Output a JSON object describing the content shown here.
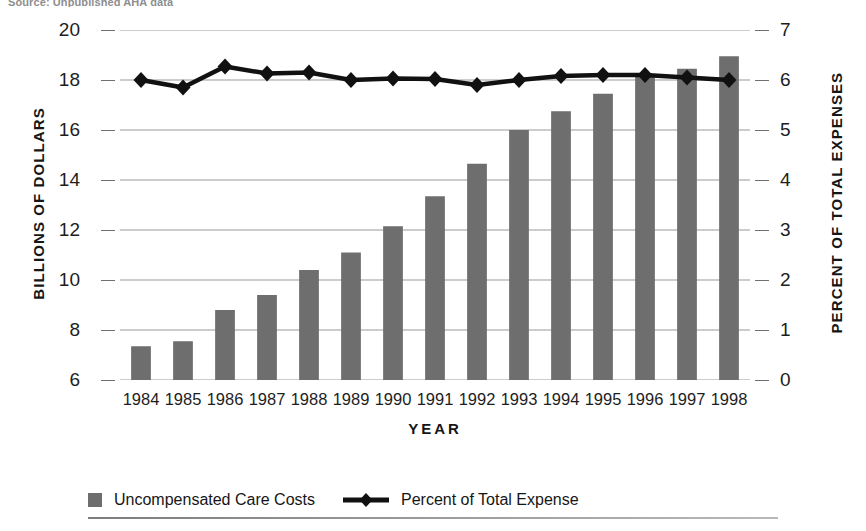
{
  "top_caption": "Source: Unpublished AHA data",
  "chart_data": {
    "type": "bar",
    "title": "",
    "subtitle": "",
    "xlabel": "YEAR",
    "ylabel": "BILLIONS OF DOLLARS",
    "y2label": "PERCENT OF TOTAL EXPENSES",
    "categories": [
      "1984",
      "1985",
      "1986",
      "1987",
      "1988",
      "1989",
      "1990",
      "1991",
      "1992",
      "1993",
      "1994",
      "1995",
      "1996",
      "1997",
      "1998"
    ],
    "ylim": [
      6,
      20
    ],
    "yticks": [
      6,
      8,
      10,
      12,
      14,
      16,
      18,
      20
    ],
    "y2lim": [
      0,
      7
    ],
    "y2ticks": [
      0,
      1,
      2,
      3,
      4,
      5,
      6,
      7
    ],
    "grid": true,
    "legend_position": "bottom",
    "series": [
      {
        "name": "Uncompensated Care Costs",
        "type": "bar",
        "axis": "left",
        "color": "#6e6e6e",
        "values": [
          7.35,
          7.55,
          8.8,
          9.4,
          10.4,
          11.1,
          12.15,
          13.35,
          14.65,
          16.0,
          16.75,
          17.45,
          18.2,
          18.45,
          18.95
        ]
      },
      {
        "name": "Percent of Total Expense",
        "type": "line",
        "axis": "right",
        "color": "#111111",
        "marker": "diamond",
        "values": [
          6.0,
          5.85,
          6.27,
          6.13,
          6.15,
          6.0,
          6.03,
          6.02,
          5.9,
          6.0,
          6.08,
          6.1,
          6.1,
          6.05,
          6.0
        ]
      }
    ]
  },
  "legend": {
    "bar_label": "Uncompensated Care Costs",
    "line_label": "Percent of Total Expense"
  }
}
